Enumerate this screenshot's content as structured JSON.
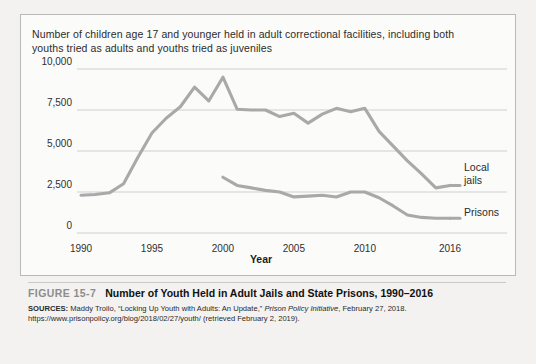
{
  "figure": {
    "subtitle": "Number of children age 17 and younger held in adult correctional facilities, including both youths tried as adults and youths tried as juveniles",
    "number_label": "FIGURE 15-7",
    "title": "Number of Youth Held in Adult Jails and State Prisons, 1990–2016",
    "sources_prefix": "SOURCES:",
    "sources_part1": " Maddy Troilo, “Locking Up Youth with Adults: An Update,” ",
    "sources_italic": "Prison Policy Initiative",
    "sources_part2": ", February 27, 2018. https://www.prisonpolicy.org/blog/2018/02/27/youth/ (retrieved February 2, 2019)."
  },
  "legend": {
    "jails_line1": "Local",
    "jails_line2": "jails",
    "prisons": "Prisons"
  },
  "colors": {
    "line": "#a9a9a9",
    "grid": "#cfcfcf",
    "panel_border": "#b9b9b9",
    "fig_number": "#8d8d8d",
    "text": "#2c2c2c"
  },
  "chart_data": {
    "type": "line",
    "title": "Number of Youth Held in Adult Jails and State Prisons, 1990–2016",
    "subtitle": "Number of children age 17 and younger held in adult correctional facilities, including both youths tried as adults and youths tried as juveniles",
    "xlabel": "Year",
    "ylabel": "",
    "xlim": [
      1990,
      2016
    ],
    "ylim": [
      0,
      10000
    ],
    "xticks": [
      1990,
      1995,
      2000,
      2005,
      2010,
      2016
    ],
    "xtick_labels": [
      "1990",
      "1995",
      "2000",
      "2005",
      "2010",
      "2016"
    ],
    "yticks": [
      0,
      2500,
      5000,
      7500,
      10000
    ],
    "ytick_labels": [
      "0",
      "2,500",
      "5,000",
      "7,500",
      "10,000"
    ],
    "grid": true,
    "legend_position": "right-inline",
    "series": [
      {
        "name": "Local jails",
        "label_lines": [
          "Local",
          "jails"
        ],
        "color": "#a9a9a9",
        "x": [
          1990,
          1991,
          1992,
          1993,
          1994,
          1995,
          1996,
          1997,
          1998,
          1999,
          2000,
          2001,
          2002,
          2003,
          2004,
          2005,
          2006,
          2007,
          2008,
          2009,
          2010,
          2011,
          2012,
          2013,
          2014,
          2015,
          2016
        ],
        "y": [
          2300,
          2350,
          2450,
          3000,
          4600,
          6100,
          7000,
          7700,
          8900,
          8050,
          9500,
          7550,
          7500,
          7500,
          7100,
          7300,
          6700,
          7250,
          7600,
          7400,
          7600,
          6200,
          5300,
          4400,
          3600,
          2750,
          2900
        ]
      },
      {
        "name": "Prisons",
        "label_lines": [
          "Prisons"
        ],
        "color": "#a9a9a9",
        "x": [
          2000,
          2001,
          2002,
          2003,
          2004,
          2005,
          2006,
          2007,
          2008,
          2009,
          2010,
          2011,
          2012,
          2013,
          2014,
          2015,
          2016
        ],
        "y": [
          3400,
          2900,
          2750,
          2600,
          2500,
          2200,
          2250,
          2300,
          2200,
          2500,
          2500,
          2150,
          1650,
          1100,
          950,
          900,
          900
        ]
      }
    ]
  }
}
